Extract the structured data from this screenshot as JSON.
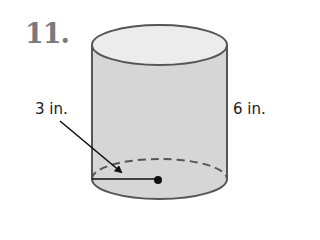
{
  "problem": {
    "number": "11."
  },
  "figure": {
    "shape": "cylinder",
    "radius_label": "3 in.",
    "height_label": "6 in.",
    "colors": {
      "body_fill": "#d6d6d6",
      "top_fill": "#ececec",
      "outline": "#555555",
      "dimension_line": "#111111"
    }
  }
}
